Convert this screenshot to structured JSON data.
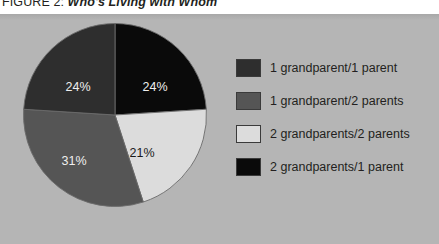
{
  "figure": {
    "label": "FIGURE 2:",
    "title": "Who's Living with Whom"
  },
  "colors": {
    "panel_background": "#b5b5b5",
    "page_background": "#ffffff",
    "text": "#231f20",
    "slice_1_grandparent_1_parent": "#2e2e2e",
    "slice_1_grandparent_2_parents": "#555555",
    "slice_2_grandparents_2_parents": "#dcdcdc",
    "slice_2_grandparents_1_parent": "#0a0a0a",
    "slice_outline": "#6b6b6b",
    "label_light": "#efefef",
    "label_dark": "#1a1a1a"
  },
  "chart_data": {
    "type": "pie",
    "title": "Who's Living with Whom",
    "xlabel": "",
    "ylabel": "",
    "legend_position": "right",
    "grid": false,
    "start_angle_deg": 0,
    "direction": "clockwise",
    "categories": [
      "2 grandparents/1 parent",
      "2 grandparents/2 parents",
      "1 grandparent/2 parents",
      "1 grandparent/1 parent"
    ],
    "values": [
      24,
      21,
      31,
      24
    ],
    "slices": [
      {
        "label": "2 grandparents/1 parent",
        "value": 24,
        "display": "24%",
        "color": "#0a0a0a",
        "label_color": "light",
        "start_deg": 0,
        "end_deg": 86.4,
        "label_x": 133,
        "label_y": 69
      },
      {
        "label": "2 grandparents/2 parents",
        "value": 21,
        "display": "21%",
        "color": "#dcdcdc",
        "label_color": "dark",
        "start_deg": 86.4,
        "end_deg": 162.0,
        "label_x": 120,
        "label_y": 135
      },
      {
        "label": "1 grandparent/2 parents",
        "value": 31,
        "display": "31%",
        "color": "#555555",
        "label_color": "light",
        "start_deg": 162.0,
        "end_deg": 273.6,
        "label_x": 52,
        "label_y": 143
      },
      {
        "label": "1 grandparent/1 parent",
        "value": 24,
        "display": "24%",
        "color": "#2e2e2e",
        "label_color": "light",
        "start_deg": 273.6,
        "end_deg": 360.0,
        "label_x": 56,
        "label_y": 69
      }
    ]
  },
  "legend": {
    "items": [
      {
        "label": "1 grandparent/1 parent",
        "color": "#2e2e2e"
      },
      {
        "label": "1 grandparent/2 parents",
        "color": "#555555"
      },
      {
        "label": "2 grandparents/2 parents",
        "color": "#dcdcdc"
      },
      {
        "label": "2 grandparents/1 parent",
        "color": "#0a0a0a"
      }
    ]
  }
}
